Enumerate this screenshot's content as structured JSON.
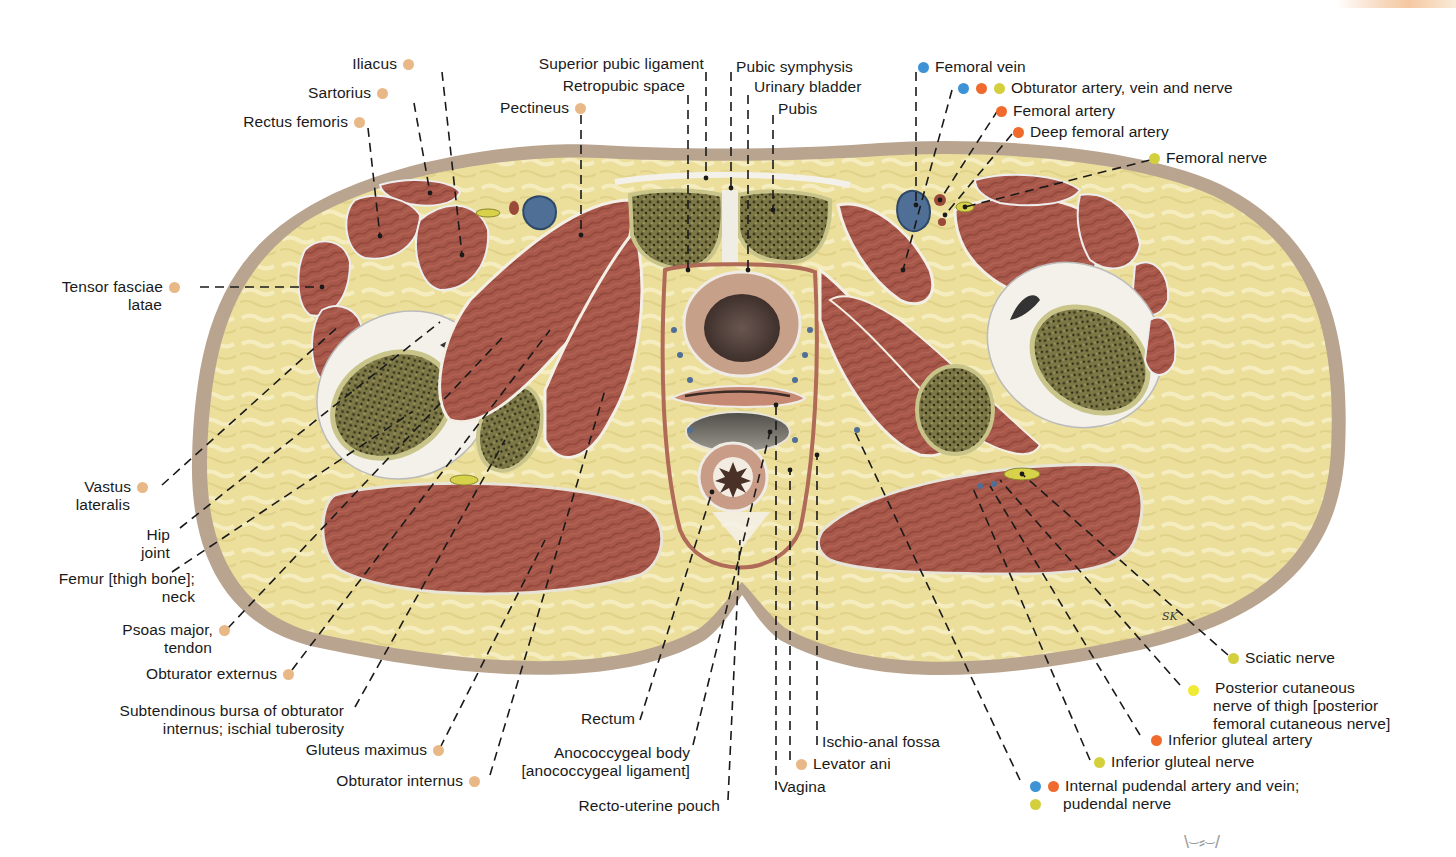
{
  "figure": {
    "artist_signature": "SK",
    "footer_mark": "\\⌣⸗⌣/",
    "colors": {
      "muscle": "#a8584a",
      "muscle_dark": "#8a4236",
      "fat": "#ecdf9c",
      "fat_light": "#f6eec0",
      "skin": "#b9a48f",
      "bone_marrow": "#6f6a3c",
      "bone_cortex": "#c9c58a",
      "fascia": "#f4f1ea",
      "vein_blue": "#4f6f97",
      "nerve_yellow": "#d8d24a",
      "leader_line": "#1a1a1a"
    }
  },
  "legend_dots": {
    "muscle": "#e9b887",
    "vein": "#3d93d6",
    "artery": "#ef6a2c",
    "nerve": "#d4cf3c",
    "nerve_light": "#f0ea34"
  },
  "labels_left": [
    {
      "id": "iliacus",
      "text": "Iliacus",
      "dots": [
        "muscle"
      ]
    },
    {
      "id": "sartorius",
      "text": "Sartorius",
      "dots": [
        "muscle"
      ]
    },
    {
      "id": "rectus-femoris",
      "text": "Rectus femoris",
      "dots": [
        "muscle"
      ]
    },
    {
      "id": "tensor-fasciae-latae",
      "text": "Tensor fasciae",
      "text2": "latae",
      "dots": [
        "muscle"
      ]
    },
    {
      "id": "vastus-lateralis",
      "text": "Vastus",
      "text2": "lateralis",
      "dots": [
        "muscle"
      ]
    },
    {
      "id": "hip-joint",
      "text": "Hip",
      "text2": "joint",
      "dots": []
    },
    {
      "id": "femur-neck",
      "text": "Femur [thigh bone];",
      "text2": "neck",
      "dots": []
    },
    {
      "id": "psoas-major-tendon",
      "text": "Psoas major,",
      "text2": "tendon",
      "dots": [
        "muscle"
      ]
    },
    {
      "id": "obturator-externus",
      "text": "Obturator externus",
      "dots": [
        "muscle"
      ]
    },
    {
      "id": "subtendinous-bursa",
      "text": "Subtendinous bursa of obturator",
      "text2": "internus; ischial tuberosity",
      "dots": []
    },
    {
      "id": "gluteus-maximus",
      "text": "Gluteus maximus",
      "dots": [
        "muscle"
      ]
    },
    {
      "id": "obturator-internus",
      "text": "Obturator internus",
      "dots": [
        "muscle"
      ]
    }
  ],
  "labels_top": [
    {
      "id": "pectineus",
      "text": "Pectineus",
      "dots": [
        "muscle"
      ]
    },
    {
      "id": "superior-pubic-ligament",
      "text": "Superior pubic ligament",
      "dots": []
    },
    {
      "id": "retropubic-space",
      "text": "Retropubic space",
      "dots": []
    },
    {
      "id": "pubic-symphysis",
      "text": "Pubic symphysis",
      "dots": []
    },
    {
      "id": "urinary-bladder",
      "text": "Urinary bladder",
      "dots": []
    },
    {
      "id": "pubis",
      "text": "Pubis",
      "dots": []
    }
  ],
  "labels_right": [
    {
      "id": "femoral-vein",
      "text": "Femoral vein",
      "dots": [
        "vein"
      ]
    },
    {
      "id": "obturator-avn",
      "text": "Obturator artery, vein and nerve",
      "dots": [
        "vein",
        "artery",
        "nerve"
      ]
    },
    {
      "id": "femoral-artery",
      "text": "Femoral artery",
      "dots": [
        "artery"
      ]
    },
    {
      "id": "deep-femoral-artery",
      "text": "Deep femoral artery",
      "dots": [
        "artery"
      ]
    },
    {
      "id": "femoral-nerve",
      "text": "Femoral nerve",
      "dots": [
        "nerve"
      ]
    },
    {
      "id": "sciatic-nerve",
      "text": "Sciatic nerve",
      "dots": [
        "nerve"
      ]
    },
    {
      "id": "posterior-cutaneous-nerve",
      "text": "Posterior cutaneous",
      "text2": "nerve of thigh [posterior",
      "text3": "femoral cutaneous nerve]",
      "dots": [
        "nerve_light"
      ]
    },
    {
      "id": "inferior-gluteal-artery",
      "text": "Inferior gluteal artery",
      "dots": [
        "artery"
      ]
    },
    {
      "id": "inferior-gluteal-nerve",
      "text": "Inferior gluteal nerve",
      "dots": [
        "nerve"
      ]
    },
    {
      "id": "internal-pudendal",
      "text": "Internal pudendal artery and vein;",
      "text2": "pudendal nerve",
      "dots": [
        "vein",
        "artery"
      ],
      "dots2": [
        "nerve"
      ]
    }
  ],
  "labels_bottom": [
    {
      "id": "rectum",
      "text": "Rectum",
      "dots": []
    },
    {
      "id": "anococcygeal-body",
      "text": "Anococcygeal body",
      "text2": "[anococcygeal ligament]",
      "dots": []
    },
    {
      "id": "recto-uterine-pouch",
      "text": "Recto-uterine pouch",
      "dots": []
    },
    {
      "id": "vagina",
      "text": "Vagina",
      "dots": []
    },
    {
      "id": "levator-ani",
      "text": "Levator ani",
      "dots": [
        "muscle"
      ]
    },
    {
      "id": "ischio-anal-fossa",
      "text": "Ischio-anal fossa",
      "dots": []
    }
  ]
}
